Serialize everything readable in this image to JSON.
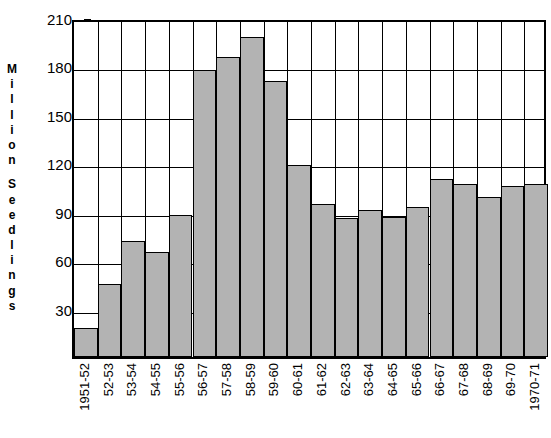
{
  "chart_data": {
    "type": "bar",
    "title": "",
    "subtitle": "",
    "xlabel": "",
    "ylabel": "Million Seedlings",
    "ylim": [
      0,
      210
    ],
    "yticks": [
      30,
      60,
      90,
      120,
      150,
      180,
      210
    ],
    "grid": true,
    "legend": null,
    "bar_fill_color": "#b3b3b3",
    "bar_edge_color": "#000000",
    "axis_color": "#000000",
    "background_color": "#ffffff",
    "categories": [
      "1951-52",
      "52-53",
      "53-54",
      "54-55",
      "55-56",
      "56-57",
      "57-58",
      "58-59",
      "59-60",
      "60-61",
      "61-62",
      "62-63",
      "63-64",
      "64-65",
      "65-66",
      "66-67",
      "67-68",
      "68-69",
      "69-70",
      "1970-71"
    ],
    "values": [
      18,
      45,
      72,
      65,
      88,
      178,
      186,
      198,
      171,
      119,
      95,
      86,
      91,
      87,
      93,
      110,
      107,
      99,
      106,
      107
    ]
  },
  "axis": {
    "y_title_letters": [
      "M",
      "i",
      "l",
      "l",
      "i",
      "o",
      "n",
      " ",
      "S",
      "e",
      "e",
      "d",
      "l",
      "i",
      "n",
      "g",
      "s"
    ]
  }
}
